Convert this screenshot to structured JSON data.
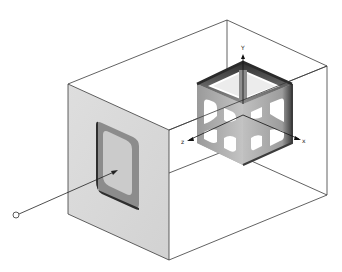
{
  "figure": {
    "colors": {
      "background": "#ffffff",
      "line": "#3a3a3a",
      "front_face": "#d9d9d9",
      "window_frame": "#8a8a8a",
      "window_inner": "#c8c8c8",
      "cube_light": "#b9b9b9",
      "cube_dark": "#4a4a4a"
    },
    "axes": {
      "x_label": "x",
      "y_label": "Y",
      "z_label": "z"
    }
  }
}
